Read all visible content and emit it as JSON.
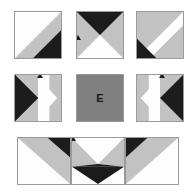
{
  "figure": {
    "grid_rows": 3,
    "grid_cols": 3,
    "center_label": "E"
  },
  "colors": {
    "black": "#1c1c1c",
    "white": "#fdfdfd",
    "light_gray": "#c2c2c2",
    "mid_gray": "#808080",
    "border": "#9a9a9a",
    "background": "#ffffff",
    "label_text": "#1a1a1a"
  },
  "tiles": [
    {
      "id": "tile-r1c1",
      "name": "tile-top-left",
      "row": 1,
      "col": 1,
      "x": 14,
      "y": 11,
      "w": 48,
      "h": 48,
      "pattern": "diagonal-band-tlbr",
      "description": "White upper-left, light gray diagonal band, black lower-right corner",
      "regions": [
        "white",
        "light_gray",
        "black"
      ],
      "label": ""
    },
    {
      "id": "tile-r1c2",
      "name": "tile-top-center",
      "row": 1,
      "col": 2,
      "x": 76,
      "y": 11,
      "w": 48,
      "h": 48,
      "pattern": "hourglass-vertical",
      "description": "Black triangle pointing down from top, white triangle pointing up from bottom, light gray side wedges",
      "regions": [
        "black",
        "white",
        "light_gray",
        "light_gray"
      ],
      "label": ""
    },
    {
      "id": "tile-r1c3",
      "name": "tile-top-right",
      "row": 1,
      "col": 3,
      "x": 136,
      "y": 11,
      "w": 48,
      "h": 48,
      "pattern": "diagonal-band-trbl",
      "description": "Light gray upper-left, white diagonal band, black lower-left corner",
      "regions": [
        "light_gray",
        "white",
        "black"
      ],
      "label": ""
    },
    {
      "id": "tile-r2c1",
      "name": "tile-middle-left",
      "row": 2,
      "col": 1,
      "x": 14,
      "y": 74,
      "w": 48,
      "h": 48,
      "pattern": "hourglass-horizontal-left-black",
      "description": "Black triangle pointing left, white triangle pointing right, light gray top and bottom wedges",
      "regions": [
        "black",
        "white",
        "light_gray",
        "light_gray"
      ],
      "label": ""
    },
    {
      "id": "tile-r2c2",
      "name": "tile-center",
      "row": 2,
      "col": 2,
      "x": 76,
      "y": 74,
      "w": 48,
      "h": 48,
      "pattern": "solid-gray-labeled",
      "description": "Solid mid gray square containing the letter E",
      "regions": [
        "mid_gray"
      ],
      "label": "E"
    },
    {
      "id": "tile-r2c3",
      "name": "tile-middle-right",
      "row": 2,
      "col": 3,
      "x": 136,
      "y": 74,
      "w": 48,
      "h": 48,
      "pattern": "hourglass-horizontal-right-black",
      "description": "White triangle pointing left, black triangle pointing right, light gray top and bottom wedges",
      "regions": [
        "white",
        "black",
        "light_gray",
        "light_gray"
      ],
      "label": ""
    },
    {
      "id": "tile-r3c1",
      "name": "tile-bottom-left",
      "row": 3,
      "col": 1,
      "x": 17,
      "y": 137,
      "w": 54,
      "h": 48,
      "pattern": "diagonal-band-bltr",
      "description": "White lower-left, light gray diagonal band, black upper-right corner",
      "regions": [
        "white",
        "light_gray",
        "black"
      ],
      "label": ""
    },
    {
      "id": "tile-r3c2",
      "name": "tile-bottom-center",
      "row": 3,
      "col": 2,
      "x": 71,
      "y": 137,
      "w": 54,
      "h": 48,
      "pattern": "hourglass-vertical-inverted",
      "description": "White triangle pointing up from top, black triangle pointing down from bottom, light gray side wedges",
      "regions": [
        "white",
        "black",
        "light_gray",
        "light_gray"
      ],
      "label": ""
    },
    {
      "id": "tile-r3c3",
      "name": "tile-bottom-right",
      "row": 3,
      "col": 3,
      "x": 125,
      "y": 137,
      "w": 54,
      "h": 48,
      "pattern": "diagonal-band-tlbr-inverted",
      "description": "Black upper-left corner, light gray diagonal band, white lower-right",
      "regions": [
        "black",
        "light_gray",
        "white"
      ],
      "label": ""
    }
  ]
}
